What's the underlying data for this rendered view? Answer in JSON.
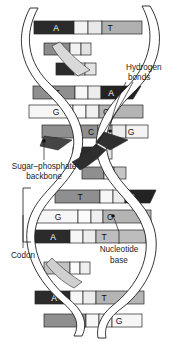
{
  "figure": {
    "width": 181,
    "height": 342,
    "background": "#ffffff"
  },
  "labels": {
    "hydrogen_bonds_line1": "Hydrogen",
    "hydrogen_bonds_line2": "bonds",
    "sugar_phosphate_line1": "Sugar–phosphate",
    "sugar_phosphate_line2": "backbone",
    "codon": "Codon",
    "nucleotide_base_line1": "Nucleotide",
    "nucleotide_base_line2": "base"
  },
  "colors": {
    "dark_base": "#2b2b2b",
    "mid_gray_base": "#8c8c8c",
    "light_gray_base": "#b9b9b9",
    "pale_base": "#f2f2f2",
    "outline": "#262626",
    "backbone_fill": "#ffffff",
    "backbone_stroke": "#1f1f1f",
    "text": "#1a1a1a"
  },
  "base_pairs": [
    {
      "id": "bp-1",
      "left": "A",
      "right": "T",
      "y": 27,
      "visible": true,
      "left_shade": "dark_base",
      "right_shade": "light_gray_base"
    },
    {
      "id": "bp-2",
      "left": "",
      "right": "",
      "y": 48,
      "visible": false,
      "left_shade": "mid_gray_base",
      "right_shade": "pale_base"
    },
    {
      "id": "bp-3",
      "left": "",
      "right": "",
      "y": 69,
      "visible": false,
      "left_shade": "dark_base",
      "right_shade": "pale_base"
    },
    {
      "id": "bp-4",
      "left": "T",
      "right": "A",
      "y": 92,
      "visible": true,
      "left_shade": "mid_gray_base",
      "right_shade": "dark_base"
    },
    {
      "id": "bp-5",
      "left": "G",
      "right": "C",
      "y": 111,
      "visible": true,
      "left_shade": "pale_base",
      "right_shade": "light_gray_base"
    },
    {
      "id": "bp-6",
      "left": "C",
      "right": "G",
      "y": 131,
      "visible": true,
      "left_shade": "mid_gray_base",
      "right_shade": "pale_base"
    },
    {
      "id": "bp-7",
      "left": "",
      "right": "",
      "y": 152,
      "visible": false,
      "left_shade": "dark_base",
      "right_shade": "pale_base"
    },
    {
      "id": "bp-8",
      "left": "",
      "right": "",
      "y": 172,
      "visible": false,
      "left_shade": "mid_gray_base",
      "right_shade": "light_gray_base"
    },
    {
      "id": "bp-9",
      "left": "T",
      "right": "A",
      "y": 196,
      "visible": true,
      "left_shade": "mid_gray_base",
      "right_shade": "dark_base"
    },
    {
      "id": "bp-10",
      "left": "G",
      "right": "C",
      "y": 216,
      "visible": true,
      "left_shade": "pale_base",
      "right_shade": "light_gray_base"
    },
    {
      "id": "bp-11",
      "left": "A",
      "right": "T",
      "y": 236,
      "visible": true,
      "left_shade": "dark_base",
      "right_shade": "light_gray_base"
    },
    {
      "id": "bp-12",
      "left": "",
      "right": "",
      "y": 268,
      "visible": false,
      "left_shade": "light_gray_base",
      "right_shade": "pale_base"
    },
    {
      "id": "bp-13",
      "left": "A",
      "right": "T",
      "y": 297,
      "visible": true,
      "left_shade": "dark_base",
      "right_shade": "light_gray_base"
    },
    {
      "id": "bp-14",
      "left": "C",
      "right": "G",
      "y": 320,
      "visible": true,
      "left_shade": "mid_gray_base",
      "right_shade": "pale_base"
    }
  ],
  "annotations": {
    "hydrogen_bond_dots": [
      {
        "x": 112,
        "y": 131
      },
      {
        "x": 114,
        "y": 216
      }
    ],
    "backbone_dot": {
      "x": 44,
      "y": 142
    },
    "codon_bracket": {
      "top": 188,
      "bottom": 242,
      "x": 23
    }
  }
}
